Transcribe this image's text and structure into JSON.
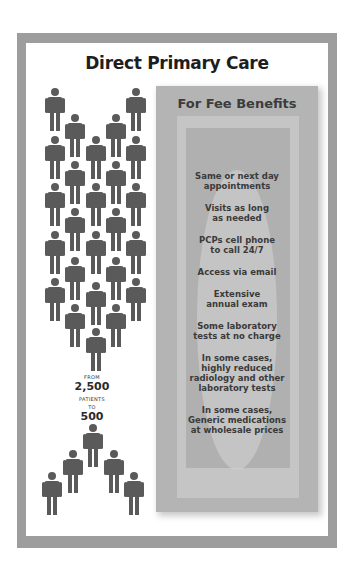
{
  "title": "Direct Primary Care",
  "stat": {
    "from_label": "FROM",
    "from_value": "2,500",
    "patients_label": "PATIENTS",
    "to_label": "TO",
    "to_value": "500"
  },
  "panel": {
    "title": "For Fee Benefits",
    "benefits": [
      "Same or next day\nappointments",
      "Visits as long\nas needed",
      "PCPs cell phone\nto call 24/7",
      "Access via email",
      "Extensive\nannual exam",
      "Some laboratory\ntests at no charge",
      "In some cases,\nhighly reduced\nradiology and other\nlaboratory tests",
      "In some cases,\nGeneric medications\nat wholesale prices"
    ]
  },
  "colors": {
    "frame": "#9d9d9d",
    "person": "#5a5a5a",
    "panel": "#b4b4b4",
    "title_text": "#1e1e1e"
  },
  "icons": {
    "people_group_large": "person-icon",
    "people_group_small": "person-icon"
  }
}
